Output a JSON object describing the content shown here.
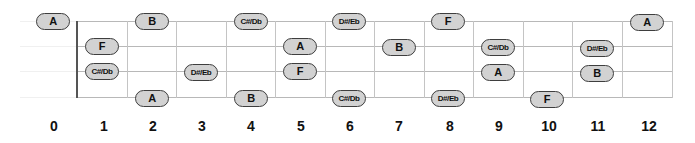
{
  "diagram": {
    "type": "fretboard-note-map",
    "colors": {
      "pill_fill": "#d2d2d2",
      "pill_border": "#3e3e3e",
      "grid_line": "#c4c4c4",
      "nut": "#555555",
      "text": "#111111"
    },
    "fret_numbers": [
      "0",
      "1",
      "2",
      "3",
      "4",
      "5",
      "6",
      "7",
      "8",
      "9",
      "10",
      "11",
      "12"
    ],
    "notes": [
      {
        "fret": 0,
        "string": 0,
        "label": "A"
      },
      {
        "fret": 1,
        "string": 1,
        "label": "F"
      },
      {
        "fret": 1,
        "string": 2,
        "label": "C#/Db"
      },
      {
        "fret": 2,
        "string": 0,
        "label": "B"
      },
      {
        "fret": 2,
        "string": 3,
        "label": "A"
      },
      {
        "fret": 3,
        "string": 2,
        "label": "D#/Eb"
      },
      {
        "fret": 4,
        "string": 0,
        "label": "C#/Db"
      },
      {
        "fret": 4,
        "string": 3,
        "label": "B"
      },
      {
        "fret": 5,
        "string": 1,
        "label": "A"
      },
      {
        "fret": 5,
        "string": 2,
        "label": "F"
      },
      {
        "fret": 6,
        "string": 0,
        "label": "D#/Eb"
      },
      {
        "fret": 6,
        "string": 3,
        "label": "C#/Db"
      },
      {
        "fret": 7,
        "string": 1,
        "label": "B"
      },
      {
        "fret": 8,
        "string": 0,
        "label": "F"
      },
      {
        "fret": 8,
        "string": 3,
        "label": "D#/Eb"
      },
      {
        "fret": 9,
        "string": 1,
        "label": "C#/Db"
      },
      {
        "fret": 9,
        "string": 2,
        "label": "A"
      },
      {
        "fret": 10,
        "string": 3,
        "label": "F"
      },
      {
        "fret": 11,
        "string": 1,
        "label": "D#/Eb"
      },
      {
        "fret": 11,
        "string": 2,
        "label": "B"
      },
      {
        "fret": 12,
        "string": 0,
        "label": "A"
      }
    ]
  }
}
